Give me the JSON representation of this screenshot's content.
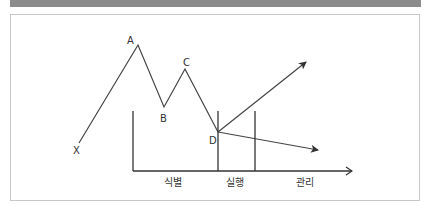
{
  "title": "",
  "colors": {
    "title_bar": "#8b8b8b",
    "line": "#333333",
    "frame": "#c8c8c8"
  },
  "points": {
    "X": "X",
    "A": "A",
    "B": "B",
    "C": "C",
    "D": "D"
  },
  "phases": {
    "identify": "식별",
    "execute": "실행",
    "manage": "관리"
  }
}
